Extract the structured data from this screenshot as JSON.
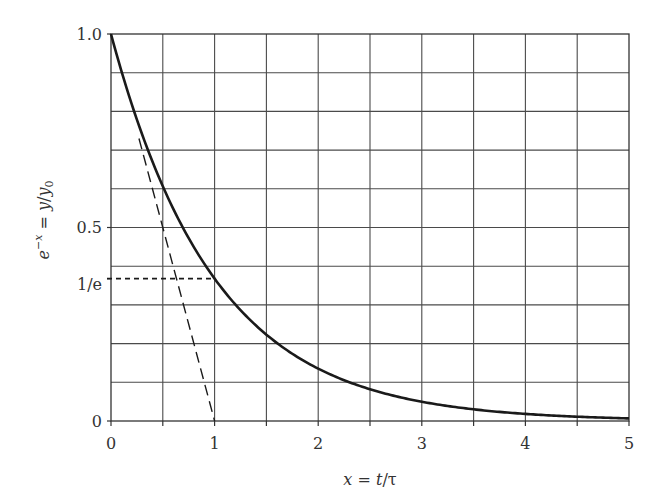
{
  "chart_data": {
    "type": "line",
    "title": "",
    "xlabel": "x = t/τ",
    "ylabel": "e^-x = y/y0",
    "xlim": [
      0,
      5
    ],
    "ylim": [
      0,
      1.0
    ],
    "grid": true,
    "grid_x_step": 0.5,
    "grid_y_step": 0.1,
    "x_ticks": [
      0,
      1,
      2,
      3,
      4,
      5
    ],
    "x_tick_labels": [
      "0",
      "1",
      "2",
      "3",
      "4",
      "5"
    ],
    "y_ticks": [
      0,
      0.3679,
      0.5,
      1.0
    ],
    "y_tick_labels": [
      "0",
      "1/e",
      "0.5",
      "1.0"
    ],
    "series": [
      {
        "name": "exponential decay e^-x",
        "style": "solid",
        "x": [
          0,
          0.25,
          0.5,
          0.75,
          1,
          1.5,
          2,
          2.5,
          3,
          3.5,
          4,
          4.5,
          5
        ],
        "y": [
          1.0,
          0.779,
          0.607,
          0.472,
          0.368,
          0.223,
          0.135,
          0.082,
          0.05,
          0.03,
          0.018,
          0.011,
          0.007
        ]
      },
      {
        "name": "initial tangent",
        "style": "long-dashed",
        "x": [
          0.27,
          1.0
        ],
        "y": [
          0.73,
          0.0
        ]
      },
      {
        "name": "1/e reference",
        "style": "short-dashed",
        "x": [
          0,
          1.0
        ],
        "y": [
          0.3679,
          0.3679
        ]
      }
    ],
    "annotations": []
  },
  "labels": {
    "x_axis": {
      "var": "x",
      "eq": " = ",
      "t": "t",
      "slash": "/",
      "tau": "τ"
    },
    "y_axis": {
      "e": "e",
      "exp": "−x",
      "eq": " = ",
      "y": "y",
      "slash": "/",
      "y0": "y",
      "sub": "0"
    },
    "x_ticks": [
      "0",
      "1",
      "2",
      "3",
      "4",
      "5"
    ],
    "y_ticks": {
      "one": "1.0",
      "half": "0.5",
      "inv_e": "1/e",
      "zero": "0"
    }
  },
  "colors": {
    "grid": "#444444",
    "curve": "#1a1a1a",
    "text": "#333333",
    "background": "#ffffff"
  }
}
